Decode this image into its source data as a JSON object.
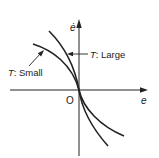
{
  "diagram": {
    "type": "phase-plane",
    "axes": {
      "x_label": "e",
      "y_label": "ė",
      "origin_label": "O"
    },
    "curves": [
      {
        "name": "small",
        "label_var": "T",
        "label_sep": ":",
        "label_value": "Small"
      },
      {
        "name": "large",
        "label_var": "T",
        "label_sep": ":",
        "label_value": "Large"
      }
    ],
    "colors": {
      "line": "#222222",
      "background": "#ffffff"
    }
  }
}
